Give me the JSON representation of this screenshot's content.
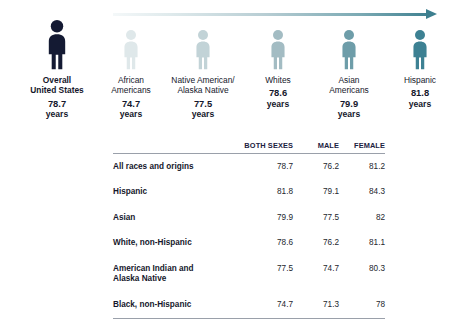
{
  "chart_data": {
    "type": "bar",
    "xlabel": "",
    "ylabel": "Life expectancy (years)",
    "unit": "years",
    "categories": [
      "Overall\nUnited States",
      "African\nAmericans",
      "Native American/\nAlaska Native",
      "Whites",
      "Asian\nAmericans",
      "Hispanic"
    ],
    "values": [
      78.7,
      74.7,
      77.5,
      78.6,
      79.9,
      81.8
    ],
    "series": [
      {
        "name": "Both sexes",
        "values": [
          78.7,
          81.8,
          79.9,
          78.6,
          77.5,
          74.7
        ]
      },
      {
        "name": "Male",
        "values": [
          76.2,
          79.1,
          77.5,
          76.2,
          74.7,
          71.3
        ]
      },
      {
        "name": "Female",
        "values": [
          81.2,
          84.3,
          82,
          81.1,
          80.3,
          78
        ]
      }
    ],
    "legend_position": "none",
    "grid": false
  },
  "arrow": {
    "name": "increasing-life-expectancy-arrow",
    "gradient_start": "#f4f8f9",
    "gradient_end": "#3d7f8f"
  },
  "pictogram": {
    "items": [
      {
        "label": "Overall\nUnited States",
        "value": "78.7",
        "unit": "years",
        "color": "#141a33",
        "primary": true,
        "left": 14,
        "width": 86,
        "scale": 1.16
      },
      {
        "label": "African\nAmericans",
        "value": "74.7",
        "unit": "years",
        "color": "#dfe8ea",
        "primary": false,
        "left": 101,
        "width": 60,
        "scale": 0.93
      },
      {
        "label": "Native American/\nAlaska Native",
        "value": "77.5",
        "unit": "years",
        "color": "#c2d3d7",
        "primary": false,
        "left": 157,
        "width": 92,
        "scale": 0.93
      },
      {
        "label": "Whites",
        "value": "78.6",
        "unit": "years",
        "color": "#a3bcc3",
        "primary": false,
        "left": 249,
        "width": 58,
        "scale": 0.93
      },
      {
        "label": "Asian\nAmericans",
        "value": "79.9",
        "unit": "years",
        "color": "#6e9da9",
        "primary": false,
        "left": 314,
        "width": 70,
        "scale": 0.93
      },
      {
        "label": "Hispanic",
        "value": "81.8",
        "unit": "years",
        "color": "#3d8193",
        "primary": false,
        "left": 390,
        "width": 60,
        "scale": 0.93
      }
    ]
  },
  "table": {
    "headers": {
      "label": "",
      "both_sexes": "BOTH SEXES",
      "male": "MALE",
      "female": "FEMALE"
    },
    "rows": [
      {
        "label": "All races and origins",
        "both_sexes": "78.7",
        "male": "76.2",
        "female": "81.2"
      },
      {
        "label": "Hispanic",
        "both_sexes": "81.8",
        "male": "79.1",
        "female": "84.3"
      },
      {
        "label": "Asian",
        "both_sexes": "79.9",
        "male": "77.5",
        "female": "82"
      },
      {
        "label": "White, non-Hispanic",
        "both_sexes": "78.6",
        "male": "76.2",
        "female": "81.1"
      },
      {
        "label": "American Indian and\nAlaska Native",
        "both_sexes": "77.5",
        "male": "74.7",
        "female": "80.3"
      },
      {
        "label": "Black, non-Hispanic",
        "both_sexes": "74.7",
        "male": "71.3",
        "female": "78"
      }
    ]
  }
}
